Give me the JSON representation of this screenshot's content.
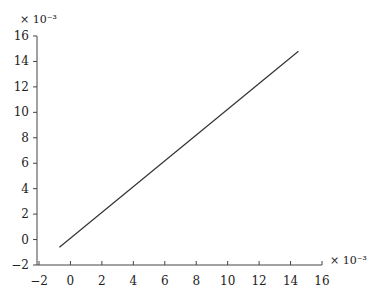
{
  "chart_data": {
    "type": "line",
    "title": "",
    "xlabel": "",
    "ylabel": "",
    "x_multiplier": "× 10⁻³",
    "y_multiplier": "× 10⁻³",
    "xlim": [
      -2,
      16
    ],
    "ylim": [
      -2,
      16
    ],
    "xticks": [
      -2,
      0,
      2,
      4,
      6,
      8,
      10,
      12,
      14,
      16
    ],
    "yticks": [
      -2,
      0,
      2,
      4,
      6,
      8,
      10,
      12,
      14,
      16
    ],
    "grid": false,
    "legend": null,
    "series": [
      {
        "name": "line",
        "x": [
          -0.7,
          14.5
        ],
        "y": [
          -0.6,
          14.8
        ],
        "color": "#333333"
      }
    ]
  }
}
